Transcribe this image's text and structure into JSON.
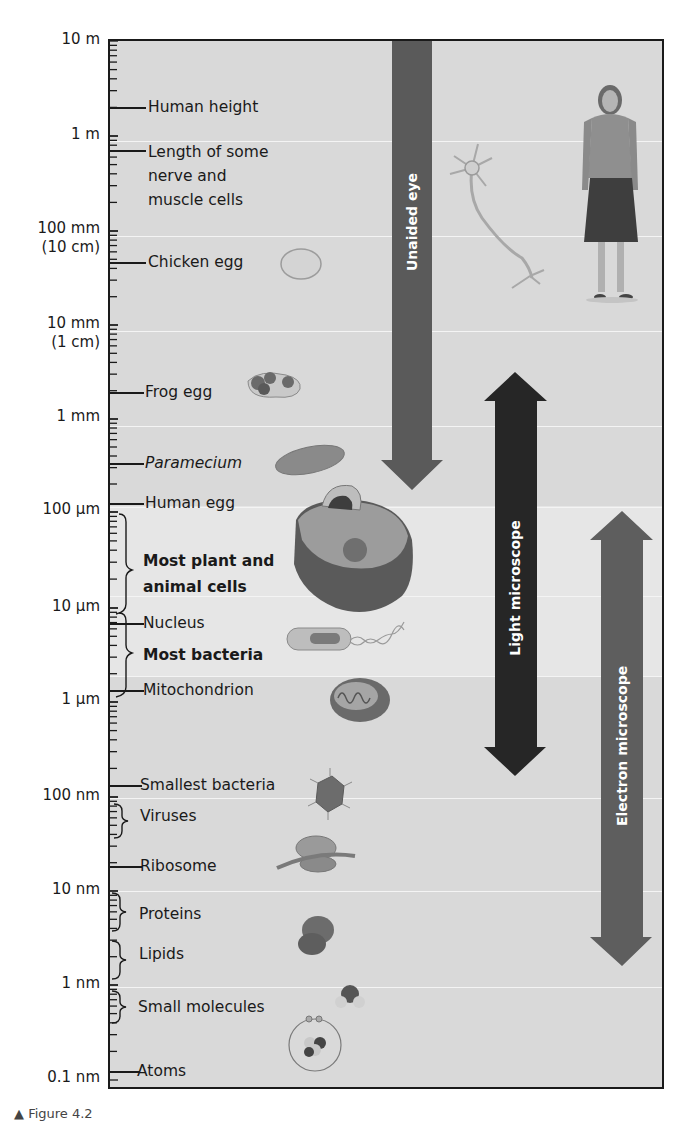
{
  "figure": {
    "scale": {
      "labels": [
        {
          "text": "10 m",
          "sub": ""
        },
        {
          "text": "1 m",
          "sub": ""
        },
        {
          "text": "100 mm",
          "sub": "(10 cm)"
        },
        {
          "text": "10 mm",
          "sub": "(1 cm)"
        },
        {
          "text": "1 mm",
          "sub": ""
        },
        {
          "text": "100 µm",
          "sub": ""
        },
        {
          "text": "10 µm",
          "sub": ""
        },
        {
          "text": "1 µm",
          "sub": ""
        },
        {
          "text": "100 nm",
          "sub": ""
        },
        {
          "text": "10 nm",
          "sub": ""
        },
        {
          "text": "1 nm",
          "sub": ""
        },
        {
          "text": "0.1 nm",
          "sub": ""
        }
      ]
    },
    "items": [
      {
        "label": "Human height",
        "style": "normal",
        "marker": "line"
      },
      {
        "label": "Length of some nerve and muscle cells",
        "lines": [
          "Length of some",
          "nerve and",
          "muscle cells"
        ],
        "style": "normal",
        "marker": "line"
      },
      {
        "label": "Chicken egg",
        "style": "normal",
        "marker": "line"
      },
      {
        "label": "Frog egg",
        "style": "normal",
        "marker": "line"
      },
      {
        "label": "Paramecium",
        "style": "italic",
        "marker": "line"
      },
      {
        "label": "Human egg",
        "style": "normal",
        "marker": "line"
      },
      {
        "label": "Most plant and animal cells",
        "lines": [
          "Most plant and",
          "animal cells"
        ],
        "style": "bold",
        "marker": "brace"
      },
      {
        "label": "Nucleus",
        "style": "normal",
        "marker": "line"
      },
      {
        "label": "Most bacteria",
        "style": "bold",
        "marker": "brace"
      },
      {
        "label": "Mitochondrion",
        "style": "normal",
        "marker": "line"
      },
      {
        "label": "Smallest bacteria",
        "style": "normal",
        "marker": "line"
      },
      {
        "label": "Viruses",
        "style": "normal",
        "marker": "brace"
      },
      {
        "label": "Ribosome",
        "style": "normal",
        "marker": "line"
      },
      {
        "label": "Proteins",
        "style": "normal",
        "marker": "brace"
      },
      {
        "label": "Lipids",
        "style": "normal",
        "marker": "brace"
      },
      {
        "label": "Small molecules",
        "style": "normal",
        "marker": "brace"
      },
      {
        "label": "Atoms",
        "style": "normal",
        "marker": "line"
      }
    ],
    "arrows": [
      {
        "label": "Unaided eye",
        "range": "10 m to ~100 µm",
        "color": "#5a5a5a"
      },
      {
        "label": "Light microscope",
        "range": "~1 mm to ~200 nm",
        "color": "#262626"
      },
      {
        "label": "Electron microscope",
        "range": "~100 µm to ~0.1 nm (approx. 1 nm shown)",
        "color": "#5e5e5e"
      }
    ],
    "illustrations": [
      "human-figure",
      "neuron",
      "chicken-egg",
      "frog-eggs",
      "paramecium",
      "animal-cell",
      "bacterium",
      "mitochondrion",
      "virus",
      "ribosome",
      "protein",
      "water-molecule",
      "atom"
    ],
    "caption_fragment": "▲ Figure 4.2"
  },
  "chart_data": {
    "type": "scale-diagram",
    "axis": {
      "scale": "log10",
      "unit": "meters",
      "ticks": [
        "10 m",
        "1 m",
        "100 mm (10 cm)",
        "10 mm (1 cm)",
        "1 mm",
        "100 µm",
        "10 µm",
        "1 µm",
        "100 nm",
        "10 nm",
        "1 nm",
        "0.1 nm"
      ]
    },
    "objects": [
      {
        "name": "Human height",
        "approx_size": "~1.7 m"
      },
      {
        "name": "Length of some nerve and muscle cells",
        "approx_size": "~0.8 m"
      },
      {
        "name": "Chicken egg",
        "approx_size": "~6 cm"
      },
      {
        "name": "Frog egg",
        "approx_size": "~2 mm"
      },
      {
        "name": "Paramecium",
        "approx_size": "~200 µm"
      },
      {
        "name": "Human egg",
        "approx_size": "~100 µm"
      },
      {
        "name": "Most plant and animal cells",
        "approx_size": "10–100 µm"
      },
      {
        "name": "Nucleus",
        "approx_size": "~8 µm"
      },
      {
        "name": "Most bacteria",
        "approx_size": "1–8 µm"
      },
      {
        "name": "Mitochondrion",
        "approx_size": "~1 µm"
      },
      {
        "name": "Smallest bacteria",
        "approx_size": "~120 nm"
      },
      {
        "name": "Viruses",
        "approx_size": "~30–90 nm"
      },
      {
        "name": "Ribosome",
        "approx_size": "~20 nm"
      },
      {
        "name": "Proteins",
        "approx_size": "~3–9 nm"
      },
      {
        "name": "Lipids",
        "approx_size": "~1–3 nm"
      },
      {
        "name": "Small molecules",
        "approx_size": "~0.3–0.9 nm"
      },
      {
        "name": "Atoms",
        "approx_size": "~0.1 nm"
      }
    ],
    "ranges": [
      {
        "name": "Unaided eye",
        "from": "10 m",
        "to": "~100 µm"
      },
      {
        "name": "Light microscope",
        "from": "~1 mm",
        "to": "~200 nm"
      },
      {
        "name": "Electron microscope",
        "from": "~100 µm",
        "to": "~0.1 nm"
      }
    ]
  }
}
